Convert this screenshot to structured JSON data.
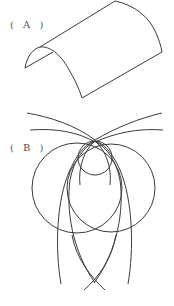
{
  "panels": [
    {
      "id": "A",
      "label": "( A )",
      "description": "half-cylinder curved surface (line drawing)"
    },
    {
      "id": "B",
      "label": "( B )",
      "description": "overlapping circles, ellipses and arcs sharing a common tangent point"
    }
  ],
  "colors": {
    "stroke": "#3a3a3a",
    "background": "#ffffff",
    "label": "#555555"
  }
}
